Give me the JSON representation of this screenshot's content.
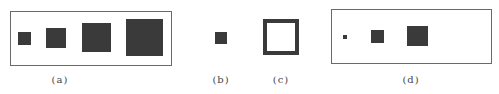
{
  "figure": {
    "panels": [
      {
        "id": "a",
        "label": "(a)",
        "framed": true,
        "squares": [
          {
            "size": 13
          },
          {
            "size": 20
          },
          {
            "size": 29
          },
          {
            "size": 37
          }
        ]
      },
      {
        "id": "b",
        "label": "(b)",
        "framed": false,
        "squares": [
          {
            "size": 12
          }
        ]
      },
      {
        "id": "c",
        "label": "(c)",
        "framed": false,
        "squares": [
          {
            "size": 36,
            "style": "outline"
          }
        ]
      },
      {
        "id": "d",
        "label": "(d)",
        "framed": true,
        "squares": [
          {
            "size": 4
          },
          {
            "size": 13
          },
          {
            "size": 21
          }
        ]
      }
    ],
    "colors": {
      "fill": "#3a3a3a",
      "frame": "#6a6a6a",
      "background": "#ffffff"
    }
  }
}
